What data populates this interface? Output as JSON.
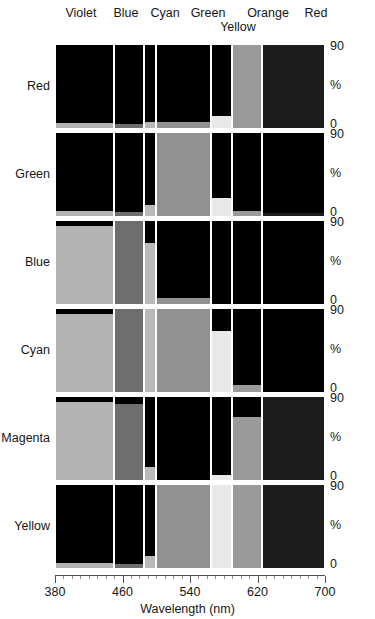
{
  "figure": {
    "band_labels": [
      "Violet",
      "Blue",
      "Cyan",
      "Green",
      "Yellow",
      "Orange",
      "Red"
    ],
    "y_tick_top": "90",
    "y_axis_unit": "%",
    "y_tick_bottom": "0",
    "x_title": "Wavelength (nm)",
    "x_ticks": [
      "380",
      "460",
      "540",
      "620",
      "700"
    ],
    "colors": {
      "background": "#ffffff",
      "plot_area": "#000000",
      "text": "#161616",
      "axis": "#4d4d4d"
    }
  },
  "chart_data": {
    "type": "bar",
    "title": "",
    "subtitle": "",
    "xlabel": "Wavelength (nm)",
    "ylabel": "%",
    "ylim": [
      0,
      90
    ],
    "xlim": [
      380,
      700
    ],
    "grid": false,
    "legend": "none",
    "x_ticks": [
      380,
      460,
      540,
      620,
      700
    ],
    "y_ticks": [
      0,
      90
    ],
    "categories": [
      "Violet",
      "Blue",
      "Cyan",
      "Green",
      "Yellow",
      "Orange",
      "Red"
    ],
    "category_ranges_nm": [
      [
        380,
        450
      ],
      [
        450,
        485
      ],
      [
        485,
        500
      ],
      [
        500,
        565
      ],
      [
        565,
        590
      ],
      [
        590,
        625
      ],
      [
        625,
        700
      ]
    ],
    "panels": [
      {
        "name": "Red",
        "values": [
          5,
          4,
          6,
          7,
          13,
          90,
          90
        ]
      },
      {
        "name": "Green",
        "values": [
          5,
          4,
          12,
          90,
          20,
          5,
          3
        ]
      },
      {
        "name": "Blue",
        "values": [
          85,
          90,
          66,
          6,
          0,
          0,
          0
        ]
      },
      {
        "name": "Cyan",
        "values": [
          85,
          90,
          90,
          90,
          66,
          8,
          0
        ]
      },
      {
        "name": "Magenta",
        "values": [
          85,
          82,
          14,
          0,
          5,
          68,
          90
        ]
      },
      {
        "name": "Yellow",
        "values": [
          5,
          4,
          13,
          90,
          90,
          90,
          90
        ]
      }
    ]
  }
}
